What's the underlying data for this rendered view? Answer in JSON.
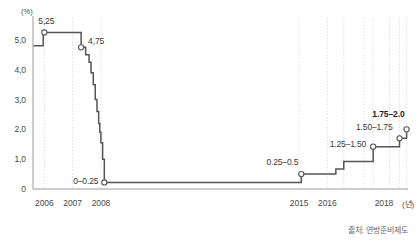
{
  "chart_data": {
    "type": "line",
    "title": "",
    "subtitle": "",
    "xlabel": "년",
    "ylabel": "(%)",
    "unit_label": "(%)",
    "x_unit_label": "(년)",
    "xlim": [
      2005.6,
      2018.85
    ],
    "ylim": [
      0,
      5.6
    ],
    "grid": "vertical-dotted",
    "legend": "none",
    "line_color": "#555555",
    "marker_color": "#ffffff",
    "marker_edge_color": "#555555",
    "gridline_color": "#d8d8d8",
    "axis_color": "#9a9a9a",
    "step_style": "post",
    "y_ticks": [
      "0",
      "1,0",
      "2,0",
      "3,0",
      "4,0",
      "5,0"
    ],
    "y_tick_values": [
      0,
      1.0,
      2.0,
      3.0,
      4.0,
      5.0
    ],
    "x_ticks": [
      "2006",
      "2007",
      "2008",
      "2015",
      "2016",
      "2018"
    ],
    "x_tick_values": [
      2006,
      2007,
      2008,
      2015,
      2016,
      2018
    ],
    "series": [
      {
        "name": "미국 연방기금금리",
        "x": [
          2005.62,
          2005.96,
          2006.5,
          2007.3,
          2007.46,
          2007.58,
          2007.65,
          2007.73,
          2007.8,
          2007.86,
          2007.92,
          2007.96,
          2008.0,
          2008.06,
          2008.12,
          2015.0,
          2015.08,
          2016.0,
          2016.3,
          2016.58,
          2017.3,
          2017.62,
          2018.2,
          2018.55,
          2018.8
        ],
        "y": [
          4.8,
          5.25,
          5.25,
          4.75,
          4.5,
          4.25,
          3.9,
          3.5,
          3.0,
          2.6,
          2.2,
          1.9,
          1.55,
          1.0,
          0.22,
          0.22,
          0.5,
          0.5,
          0.67,
          0.92,
          0.92,
          1.42,
          1.42,
          1.7,
          2.0
        ]
      }
    ],
    "annotations": [
      {
        "label": "5,25",
        "value": 5.25,
        "x": 2006.0,
        "bold": false,
        "marker": true
      },
      {
        "label": "4,75",
        "value": 4.75,
        "x": 2007.3,
        "bold": false,
        "marker": true
      },
      {
        "label": "0–0.25",
        "value": 0.22,
        "x": 2008.12,
        "bold": false,
        "marker": true
      },
      {
        "label": "0.25–0.5",
        "value": 0.5,
        "x": 2015.08,
        "bold": false,
        "marker": true
      },
      {
        "label": "1.25–1.50",
        "value": 1.42,
        "x": 2017.62,
        "bold": false,
        "marker": true
      },
      {
        "label": "1.50–1.75",
        "value": 1.7,
        "x": 2018.55,
        "bold": false,
        "marker": true
      },
      {
        "label": "1.75–2.0",
        "value": 2.0,
        "x": 2018.8,
        "bold": true,
        "marker": true
      }
    ],
    "gridlines_x": [
      2006,
      2007,
      2008,
      2015,
      2016,
      2016.58,
      2017.3,
      2017.62,
      2018.2,
      2018.55,
      2018.8
    ]
  },
  "source": {
    "text": "출처: 연방준비제도"
  }
}
